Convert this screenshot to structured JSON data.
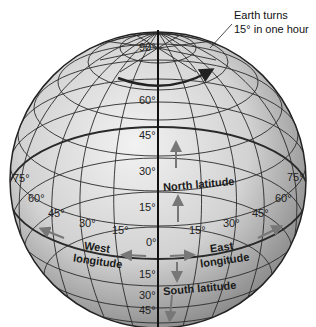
{
  "diagram": {
    "annotation": {
      "line1": "Earth turns",
      "line2": "15° in one hour"
    },
    "latitude_labels": {
      "north": [
        "90°",
        "60°",
        "45°",
        "30°",
        "15°"
      ],
      "equator": "0°",
      "south": [
        "15°",
        "30°",
        "45°"
      ]
    },
    "longitude_labels": {
      "west": [
        "75°",
        "60°",
        "45°",
        "30°",
        "15°"
      ],
      "east": [
        "15°",
        "30°",
        "45°",
        "60°",
        "75°"
      ]
    },
    "region_labels": {
      "north_latitude": "North latitude",
      "south_latitude": "South latitude",
      "west_longitude_1": "West",
      "west_longitude_2": "longitude",
      "east_longitude_1": "East",
      "east_longitude_2": "longitude"
    },
    "colors": {
      "globe_light": "#e6e6e6",
      "globe_dark": "#8a8a8a",
      "grid": "#2a2a2a",
      "arrow": "#7a7a7a"
    }
  }
}
